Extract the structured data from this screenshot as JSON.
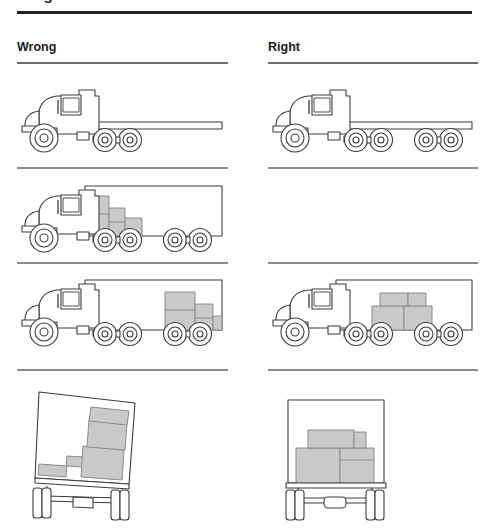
{
  "document": {
    "title_partial": "Weight Distribution",
    "headers": {
      "wrong": "Wrong",
      "right": "Right"
    }
  },
  "colors": {
    "outline": "#3c3c3c",
    "cargo_fill": "#c9c9c9",
    "cargo_stroke": "#8c8c8c",
    "rule_dark": "#222222",
    "rule_gray": "#8a8a8a",
    "page_bg": "#ffffff"
  },
  "rows": [
    {
      "row": 1,
      "left": {
        "caption": "Empty flatbed chassis truck, three axles",
        "vehicle": "flatbed-truck",
        "axles": 3,
        "cargo": "none",
        "present": true
      },
      "right": {
        "caption": "Empty flatbed chassis truck, five axles",
        "vehicle": "flatbed-truck",
        "axles": 5,
        "cargo": "none",
        "present": true
      }
    },
    {
      "row": 2,
      "left": {
        "caption": "Box trailer with cargo stacked at the front, stepped down toward rear",
        "vehicle": "box-trailer-truck",
        "axles": 5,
        "cargo": "front-loaded",
        "present": true
      },
      "right": {
        "caption": "",
        "vehicle": "none",
        "axles": 0,
        "cargo": "none",
        "present": false
      }
    },
    {
      "row": 3,
      "left": {
        "caption": "Box trailer with cargo stacked at the rear",
        "vehicle": "box-trailer-truck",
        "axles": 5,
        "cargo": "rear-loaded",
        "present": true
      },
      "right": {
        "caption": "Box trailer with cargo centered over the axles",
        "vehicle": "box-trailer-truck",
        "axles": 5,
        "cargo": "centered",
        "present": true
      }
    },
    {
      "row": 4,
      "left": {
        "caption": "Rear view of trailer leaning to one side, cargo piled unevenly against one wall",
        "vehicle": "trailer-rear-view",
        "axles": 1,
        "cargo": "side-loaded-tilted",
        "present": true
      },
      "right": {
        "caption": "Rear view of level trailer, cargo balanced and centered",
        "vehicle": "trailer-rear-view",
        "axles": 1,
        "cargo": "balanced-centered",
        "present": true
      }
    }
  ]
}
